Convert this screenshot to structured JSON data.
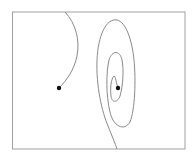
{
  "diagram": {
    "type": "phase-portrait",
    "frame": {
      "x": 13,
      "y": 12,
      "width": 172,
      "height": 137,
      "stroke": "#9a9a9a"
    },
    "curve_color": "#8a8a8a",
    "point_color": "#111111",
    "points": [
      {
        "name": "left-equilibrium",
        "x": 59,
        "y": 88
      },
      {
        "name": "spiral-center",
        "x": 118,
        "y": 88
      }
    ],
    "curves": [
      {
        "name": "left-trajectory",
        "d": "M65,12 C76,24 80,40 77,56 C74,70 67,80 59,88"
      },
      {
        "name": "spiral-trajectory",
        "d": "M118,88 C116,83 116,77 114,76 C111,79 110,88 111,96 C112,104 118,102 120,96 C123,86 124,70 122,60 C120,50 112,50 109,60 C106,72 106,96 110,112 C113,126 124,132 130,122 C135,110 136,80 134,60 C132,40 126,22 117,20 C106,18 98,36 97,60 C96,86 102,112 108,126 C112,136 115,143 117,149"
      }
    ]
  }
}
